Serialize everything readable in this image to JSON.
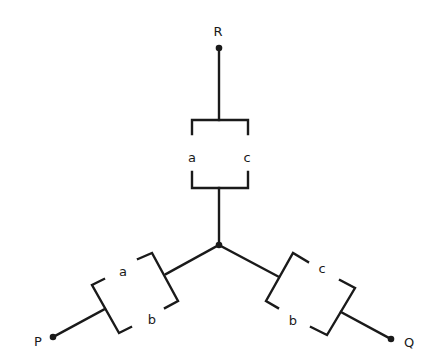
{
  "diagram": {
    "terminals": [
      {
        "id": "R",
        "label": "R"
      },
      {
        "id": "P",
        "label": "P"
      },
      {
        "id": "Q",
        "label": "Q"
      }
    ],
    "branches": {
      "top": {
        "to": "R",
        "elements": [
          "a",
          "c"
        ]
      },
      "left": {
        "to": "P",
        "elements": [
          "a",
          "b"
        ]
      },
      "right": {
        "to": "Q",
        "elements": [
          "c",
          "b"
        ]
      }
    },
    "colors": {
      "ink": "#1a1a1a",
      "background": "#ffffff"
    }
  }
}
